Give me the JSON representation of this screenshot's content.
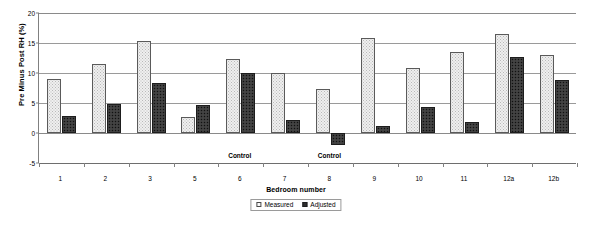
{
  "chart_data": {
    "type": "bar",
    "title": "",
    "xlabel": "Bedroom number",
    "ylabel": "Pre Minus Post RH (%)",
    "categories": [
      "1",
      "2",
      "3",
      "5",
      "6",
      "7",
      "8",
      "9",
      "10",
      "11",
      "12a",
      "12b"
    ],
    "series": [
      {
        "name": "Measured",
        "values": [
          9.0,
          11.5,
          15.3,
          2.7,
          12.3,
          10.0,
          7.3,
          15.8,
          10.8,
          13.5,
          16.5,
          13.0
        ]
      },
      {
        "name": "Adjusted",
        "values": [
          2.8,
          4.9,
          8.4,
          4.7,
          10.0,
          2.1,
          -2.0,
          1.2,
          4.3,
          1.8,
          12.6,
          8.9
        ]
      }
    ],
    "ylim": [
      -5,
      20
    ],
    "yticks": [
      -5,
      0,
      5,
      10,
      15,
      20
    ],
    "ytick_labels": [
      "-5",
      "0",
      "5",
      "10",
      "15",
      "20"
    ],
    "grid": true,
    "legend_position": "bottom-center",
    "annotations": [
      {
        "text": "Control",
        "category": "6"
      },
      {
        "text": "Control",
        "category": "8"
      }
    ]
  },
  "legend": {
    "items": [
      {
        "label": "Measured",
        "swatch": "measured-swatch-icon"
      },
      {
        "label": "Adjusted",
        "swatch": "adjusted-swatch-icon"
      }
    ]
  }
}
